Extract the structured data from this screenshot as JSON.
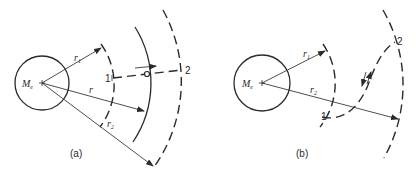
{
  "figure": {
    "panels": [
      {
        "id": "a",
        "caption": "(a)",
        "planet_label": "M",
        "planet_subscript": "e",
        "labels": {
          "r1": "r",
          "r1_sub": "1",
          "r": "r",
          "r2": "r",
          "r2_sub": "2",
          "point1": "1",
          "point2": "2"
        },
        "description": "Radial transfer from inner orbit 1 to outer orbit 2 along a straight dashed path"
      },
      {
        "id": "b",
        "caption": "(b)",
        "planet_label": "M",
        "planet_subscript": "e",
        "labels": {
          "r1": "r",
          "r1_sub": "1",
          "r2": "r",
          "r2_sub": "2",
          "point1": "1",
          "point2": "2"
        },
        "description": "Curved (elliptical) transfer from orbit 1 at r1 to orbit 2 at r2"
      }
    ],
    "colors": {
      "ink": "#2a2a2a",
      "background": "#ffffff"
    }
  }
}
